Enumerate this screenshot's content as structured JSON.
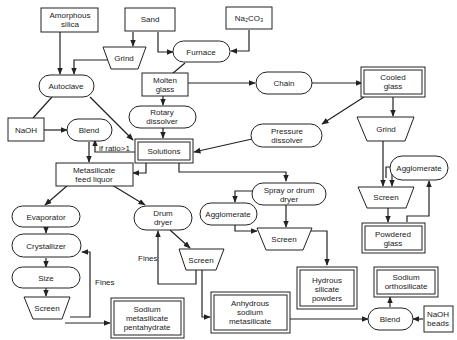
{
  "diagram": {
    "nodes": {
      "amorphous_silica": {
        "line1": "Amorphous",
        "line2": "silica"
      },
      "sand": {
        "line1": "Sand"
      },
      "na2co3": {
        "line1": "Na₂CO₃"
      },
      "grind_top": {
        "line1": "Grind"
      },
      "furnace": {
        "line1": "Furnace"
      },
      "autoclave": {
        "line1": "Autoclave"
      },
      "molten_glass": {
        "line1": "Molten",
        "line2": "glass"
      },
      "chain": {
        "line1": "Chain"
      },
      "cooled_glass": {
        "line1": "Cooled",
        "line2": "glass"
      },
      "rotary_dissolver": {
        "line1": "Rotary",
        "line2": "dissolver"
      },
      "naoh": {
        "line1": "NaOH"
      },
      "blend_top": {
        "line1": "Blend"
      },
      "solutions": {
        "line1": "Solutions"
      },
      "pressure_dissolver": {
        "line1": "Pressure",
        "line2": "dissolver"
      },
      "grind_right": {
        "line1": "Grind"
      },
      "metasilicate_feed": {
        "line1": "Metasilicate",
        "line2": "feed  liquor"
      },
      "spray_drum_dryer": {
        "line1": "Spray  or  drum",
        "line2": "dryer"
      },
      "agglomerate_right": {
        "line1": "Agglomerate"
      },
      "evaporator": {
        "line1": "Evaporator"
      },
      "drum_dryer": {
        "line1": "Drum",
        "line2": "dryer"
      },
      "agglomerate_mid": {
        "line1": "Agglomerate"
      },
      "screen_mid": {
        "line1": "Screen"
      },
      "screen_right": {
        "line1": "Screen"
      },
      "crystallizer": {
        "line1": "Crystallizer"
      },
      "powdered_glass": {
        "line1": "Powdered",
        "line2": "glass"
      },
      "size": {
        "line1": "Size"
      },
      "screen_drum": {
        "line1": "Screen"
      },
      "hydrous_silicate": {
        "line1": "Hydrous",
        "line2": "silicate",
        "line3": "powders"
      },
      "sodium_orthosilicate": {
        "line1": "Sodium",
        "line2": "orthosilicate"
      },
      "screen_left": {
        "line1": "Screen"
      },
      "sodium_metasilicate_penta": {
        "line1": "Sodium",
        "line2": "metasilicate",
        "line3": "pentahydrate"
      },
      "anhydrous_metasilicate": {
        "line1": "Anhydrous",
        "line2": "sodium",
        "line3": "metasilicate"
      },
      "blend_bottom": {
        "line1": "Blend"
      },
      "naoh_beads": {
        "line1": "NaOH",
        "line2": "beads"
      }
    },
    "edge_labels": {
      "if_ratio": "if  ratio>1",
      "fines_left": "Fines",
      "fines_mid": "Fines"
    }
  }
}
